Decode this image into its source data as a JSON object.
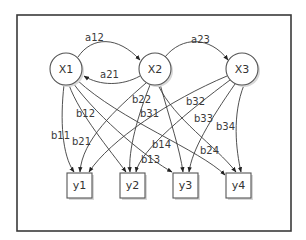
{
  "diagram": {
    "type": "directed-graph",
    "latent_nodes": [
      {
        "id": "X1",
        "label": "X1"
      },
      {
        "id": "X2",
        "label": "X2"
      },
      {
        "id": "X3",
        "label": "X3"
      }
    ],
    "observed_nodes": [
      {
        "id": "y1",
        "label": "y1"
      },
      {
        "id": "y2",
        "label": "y2"
      },
      {
        "id": "y3",
        "label": "y3"
      },
      {
        "id": "y4",
        "label": "y4"
      }
    ],
    "transition_edges": [
      {
        "from": "X1",
        "to": "X2",
        "label": "a12"
      },
      {
        "from": "X2",
        "to": "X1",
        "label": "a21"
      },
      {
        "from": "X2",
        "to": "X3",
        "label": "a23"
      }
    ],
    "emission_edges": [
      {
        "from": "X1",
        "to": "y1",
        "label": "b11"
      },
      {
        "from": "X1",
        "to": "y2",
        "label": "b12"
      },
      {
        "from": "X1",
        "to": "y3",
        "label": "b13"
      },
      {
        "from": "X1",
        "to": "y4",
        "label": "b14"
      },
      {
        "from": "X2",
        "to": "y1",
        "label": "b21"
      },
      {
        "from": "X2",
        "to": "y2",
        "label": "b22"
      },
      {
        "from": "X2",
        "to": "y4",
        "label": "b24"
      },
      {
        "from": "X3",
        "to": "y1",
        "label": "b31"
      },
      {
        "from": "X3",
        "to": "y2",
        "label": "b32"
      },
      {
        "from": "X3",
        "to": "y3",
        "label": "b33"
      },
      {
        "from": "X3",
        "to": "y4",
        "label": "b34"
      }
    ]
  }
}
